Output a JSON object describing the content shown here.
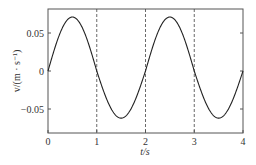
{
  "chart_data": {
    "type": "line",
    "title": "",
    "xlabel": "t/s",
    "ylabel": "v/(m · s⁻¹)",
    "xlim": [
      0,
      4
    ],
    "ylim": [
      -0.078,
      0.08
    ],
    "grid": false,
    "legend": null,
    "x_ticks": [
      0,
      1,
      2,
      3,
      4
    ],
    "x_tick_labels": [
      "0",
      "1",
      "2",
      "3",
      "4"
    ],
    "y_ticks": [
      -0.05,
      0,
      0.05
    ],
    "y_tick_labels": [
      "−0.05",
      "0",
      "0.05"
    ],
    "vertical_dashed_lines": [
      1,
      2,
      3
    ],
    "series": [
      {
        "name": "v(t)",
        "style": "solid",
        "color": "#222222",
        "x": [
          0,
          0.25,
          0.5,
          0.75,
          1.0,
          1.25,
          1.5,
          1.75,
          2.0,
          2.25,
          2.5,
          2.75,
          3.0,
          3.25,
          3.5,
          3.75,
          4.0
        ],
        "values": [
          0,
          0.05,
          0.071,
          0.05,
          0,
          -0.044,
          -0.062,
          -0.044,
          0,
          0.05,
          0.071,
          0.05,
          0,
          -0.044,
          -0.062,
          -0.044,
          0
        ]
      }
    ]
  }
}
